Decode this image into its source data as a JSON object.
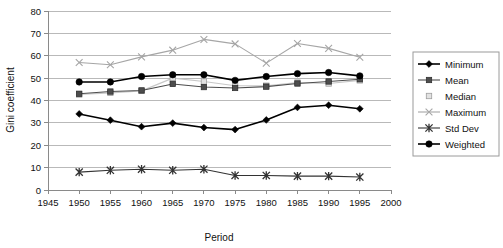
{
  "chart_data": {
    "type": "line",
    "title": "",
    "xlabel": "Period",
    "ylabel": "Gini coefficient",
    "xlim": [
      1945,
      2000
    ],
    "ylim": [
      0,
      80
    ],
    "xticks": [
      1945,
      1950,
      1955,
      1960,
      1965,
      1970,
      1975,
      1980,
      1985,
      1990,
      1995,
      2000
    ],
    "yticks": [
      0,
      10,
      20,
      30,
      40,
      50,
      60,
      70,
      80
    ],
    "grid": "horizontal",
    "legend_position": "right",
    "x": [
      1950,
      1955,
      1960,
      1965,
      1970,
      1975,
      1980,
      1985,
      1990,
      1995
    ],
    "series": [
      {
        "name": "Minimum",
        "marker": "diamond",
        "color": "#000000",
        "values": [
          34.0,
          31.2,
          28.3,
          29.9,
          27.9,
          27.0,
          31.3,
          36.9,
          37.9,
          36.3
        ]
      },
      {
        "name": "Mean",
        "marker": "square",
        "color": "#4d4d4d",
        "values": [
          43.0,
          44.0,
          44.5,
          47.4,
          46.0,
          45.6,
          46.2,
          47.6,
          48.5,
          49.5
        ]
      },
      {
        "name": "Median",
        "marker": "square-light",
        "color": "#c8c8c8",
        "values": [
          42.7,
          43.4,
          44.3,
          50.0,
          48.5,
          46.6,
          46.6,
          48.0,
          47.6,
          49.0
        ]
      },
      {
        "name": "Maximum",
        "marker": "cross",
        "color": "#a6a6a6",
        "values": [
          57.0,
          56.0,
          59.5,
          62.5,
          67.3,
          65.3,
          56.7,
          65.5,
          63.3,
          59.3
        ]
      },
      {
        "name": "Std Dev",
        "marker": "star",
        "color": "#333333",
        "values": [
          8.0,
          8.8,
          9.3,
          8.8,
          9.3,
          6.5,
          6.5,
          6.2,
          6.2,
          5.8
        ]
      },
      {
        "name": "Weighted",
        "marker": "circle",
        "color": "#000000",
        "values": [
          48.3,
          48.3,
          50.7,
          51.5,
          51.5,
          49.0,
          50.7,
          52.0,
          52.5,
          51.0
        ]
      }
    ]
  },
  "legend": {
    "items": [
      {
        "label": "Minimum"
      },
      {
        "label": "Mean"
      },
      {
        "label": "Median"
      },
      {
        "label": "Maximum"
      },
      {
        "label": "Std Dev"
      },
      {
        "label": "Weighted"
      }
    ]
  }
}
